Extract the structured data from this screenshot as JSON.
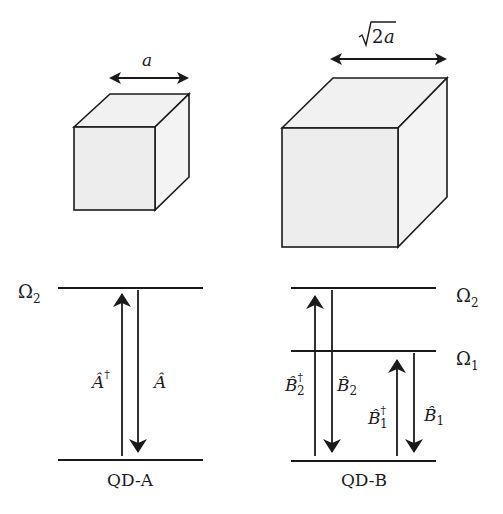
{
  "qd_a": {
    "cube_dimension_label": "a",
    "levels": [
      {
        "name": "Ω",
        "sub": "2"
      }
    ],
    "operators": {
      "creation": {
        "base": "Â",
        "sup": "†"
      },
      "annihilation": {
        "base": "Â"
      }
    },
    "caption": "QD-A"
  },
  "qd_b": {
    "cube_dimension_label": "√2a",
    "cube_dimension_parts": {
      "radical": "√",
      "radicand": "2",
      "var": "a"
    },
    "levels": [
      {
        "name": "Ω",
        "sub": "2"
      },
      {
        "name": "Ω",
        "sub": "1"
      }
    ],
    "operators": {
      "creation_2": {
        "base": "B̂",
        "sub": "2",
        "sup": "†"
      },
      "annihilation_2": {
        "base": "B̂",
        "sub": "2"
      },
      "creation_1": {
        "base": "B̂",
        "sub": "1",
        "sup": "†"
      },
      "annihilation_1": {
        "base": "B̂",
        "sub": "1"
      }
    },
    "caption": "QD-B"
  },
  "colors": {
    "stroke": "#1a1a1a",
    "cube_fill": "#eeeeee",
    "cube_side": "#f3f3f3",
    "cube_top": "#f1f1f1"
  }
}
